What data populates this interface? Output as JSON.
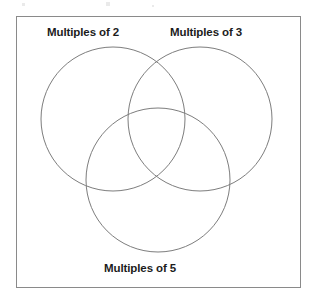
{
  "diagram": {
    "type": "venn-diagram",
    "set_count": 3,
    "labels": {
      "left": "Multiples of 2",
      "right": "Multiples of 3",
      "bottom": "Multiples of 5"
    },
    "frame": {
      "border_color": "#8a8a8a",
      "background": "#ffffff"
    },
    "circles": [
      {
        "name": "multiples-of-2",
        "cx": 113,
        "cy": 119,
        "r": 72,
        "stroke": "#7d7d7d"
      },
      {
        "name": "multiples-of-3",
        "cx": 200,
        "cy": 119,
        "r": 72,
        "stroke": "#7d7d7d"
      },
      {
        "name": "multiples-of-5",
        "cx": 158,
        "cy": 180,
        "r": 72,
        "stroke": "#7d7d7d"
      }
    ],
    "regions": [
      "multiples of 2 only",
      "multiples of 3 only",
      "multiples of 5 only",
      "multiples of 2 and 3",
      "multiples of 2 and 5",
      "multiples of 3 and 5",
      "multiples of 2, 3 and 5"
    ]
  }
}
